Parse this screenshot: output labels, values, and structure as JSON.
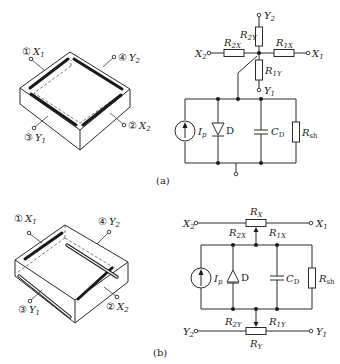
{
  "figure": {
    "panel_a": {
      "caption": "(a)",
      "device_labels": {
        "x1": {
          "num": "①",
          "name": "X",
          "sub": "1"
        },
        "y2": {
          "num": "④",
          "name": "Y",
          "sub": "2"
        },
        "y1": {
          "num": "③",
          "name": "Y",
          "sub": "1"
        },
        "x2": {
          "num": "②",
          "name": "X",
          "sub": "2"
        }
      },
      "circuit": {
        "terminals": {
          "y2": {
            "name": "Y",
            "sub": "2"
          },
          "x2": {
            "name": "X",
            "sub": "2"
          },
          "x1": {
            "name": "X",
            "sub": "1"
          },
          "y1": {
            "name": "Y",
            "sub": "1"
          }
        },
        "resistors": {
          "r2y": {
            "name": "R",
            "sub": "2Y"
          },
          "r2x": {
            "name": "R",
            "sub": "2X"
          },
          "r1x": {
            "name": "R",
            "sub": "1X"
          },
          "r1y": {
            "name": "R",
            "sub": "1Y"
          }
        },
        "source": {
          "name": "I",
          "sub": "p"
        },
        "diode": {
          "name": "D"
        },
        "capacitor": {
          "name": "C",
          "sub": "D"
        },
        "shunt": {
          "name": "R",
          "sub": "sh"
        }
      }
    },
    "panel_b": {
      "caption": "(b)",
      "device_labels": {
        "x1": {
          "num": "①",
          "name": "X",
          "sub": "1"
        },
        "y2": {
          "num": "④",
          "name": "Y",
          "sub": "2"
        },
        "y1": {
          "num": "③",
          "name": "Y",
          "sub": "1"
        },
        "x2": {
          "num": "②",
          "name": "X",
          "sub": "2"
        }
      },
      "circuit": {
        "terminals": {
          "x2": {
            "name": "X",
            "sub": "2"
          },
          "x1": {
            "name": "X",
            "sub": "1"
          },
          "y2": {
            "name": "Y",
            "sub": "2"
          },
          "y1": {
            "name": "Y",
            "sub": "1"
          }
        },
        "resistors": {
          "rx": {
            "name": "R",
            "sub": "X"
          },
          "r2x": {
            "name": "R",
            "sub": "2X"
          },
          "r1x": {
            "name": "R",
            "sub": "1X"
          },
          "ry": {
            "name": "R",
            "sub": "Y"
          },
          "r2y": {
            "name": "R",
            "sub": "2Y"
          },
          "r1y": {
            "name": "R",
            "sub": "1Y"
          }
        },
        "source": {
          "name": "I",
          "sub": "p"
        },
        "diode": {
          "name": "D"
        },
        "capacitor": {
          "name": "C",
          "sub": "D"
        },
        "shunt": {
          "name": "R",
          "sub": "sh"
        }
      }
    }
  }
}
